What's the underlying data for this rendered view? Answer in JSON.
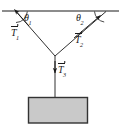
{
  "figure": {
    "background_color": "#ffffff",
    "line_color": "#1a1a1a",
    "block_fill_color": "#c9c9c9",
    "block_border_color": "#333333",
    "labels": {
      "theta1": "θ",
      "theta1_sub": "1",
      "theta2": "θ",
      "theta2_sub": "2",
      "T1": "T",
      "T1_sub": "1",
      "T2": "T",
      "T2_sub": "2",
      "T3": "T",
      "T3_sub": "3"
    },
    "geometry": {
      "ceiling_y": 11,
      "ceiling_x_start": 2,
      "ceiling_x_end": 119,
      "anchor_left": [
        16,
        11
      ],
      "anchor_right": [
        106,
        11
      ],
      "junction": [
        55,
        56
      ],
      "block_top": 97,
      "block_bottom": 123,
      "block_left": 28,
      "block_right": 88
    }
  }
}
